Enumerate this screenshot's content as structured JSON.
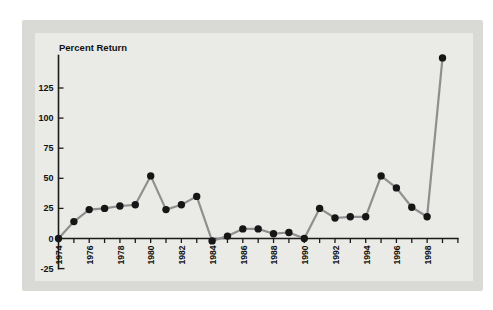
{
  "figure": {
    "colors": {
      "page_background": "#ffffff",
      "panel_frame": "#d9d9d5",
      "plot_background": "#eaeae6",
      "line": "#8f8f8f",
      "point": "#161616",
      "axis": "#1b1b1b",
      "label_text": "#111111"
    }
  },
  "chart_data": {
    "type": "line",
    "title": "Percent Return",
    "xlabel": "",
    "ylabel": "Percent Return",
    "x": [
      1974,
      1975,
      1976,
      1977,
      1978,
      1979,
      1980,
      1981,
      1982,
      1983,
      1984,
      1985,
      1986,
      1987,
      1988,
      1989,
      1990,
      1991,
      1992,
      1993,
      1994,
      1995,
      1996,
      1997,
      1998,
      1999
    ],
    "y": [
      0,
      14,
      24,
      25,
      27,
      28,
      52,
      24,
      28,
      35,
      -2,
      2,
      8,
      8,
      4,
      5,
      0,
      25,
      17,
      18,
      18,
      52,
      42,
      26,
      18,
      150
    ],
    "xlim": [
      1974,
      2000
    ],
    "ylim": [
      -25,
      152
    ],
    "x_tick_interval": 1,
    "x_tick_labels": [
      "1974",
      "1976",
      "1978",
      "1980",
      "1982",
      "1984",
      "1986",
      "1988",
      "1990",
      "1992",
      "1994",
      "1996",
      "1998"
    ],
    "y_tick_values": [
      25,
      50,
      75,
      100,
      125
    ],
    "y_tick_labels": [
      "-25",
      "0",
      "25",
      "50",
      "75",
      "100",
      "125"
    ],
    "grid": false,
    "legend": false
  }
}
